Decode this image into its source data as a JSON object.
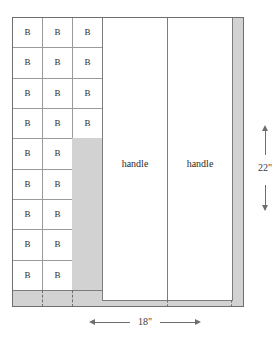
{
  "diagram": {
    "title": "",
    "piece_label": "B",
    "handle_label": "handle",
    "colors": {
      "waste_fill": "#d2d2d2",
      "panel_fill": "#ffffff",
      "stroke": "#6e6e6e",
      "cell_stroke": "#9a9a9a",
      "text": "#2a2a2a"
    },
    "b_columns": [
      {
        "name": "column-1",
        "count": 9
      },
      {
        "name": "column-2",
        "count": 9
      },
      {
        "name": "column-3",
        "count": 4
      }
    ],
    "b_cells_total": 22,
    "handles": [
      {
        "label": "handle"
      },
      {
        "label": "handle"
      }
    ],
    "dimensions": {
      "width_label": "18\"",
      "height_label": "22\""
    },
    "waste_regions": [
      {
        "name": "column-3-lower-waste"
      },
      {
        "name": "bottom-band-waste"
      },
      {
        "name": "right-edge-waste"
      }
    ]
  }
}
